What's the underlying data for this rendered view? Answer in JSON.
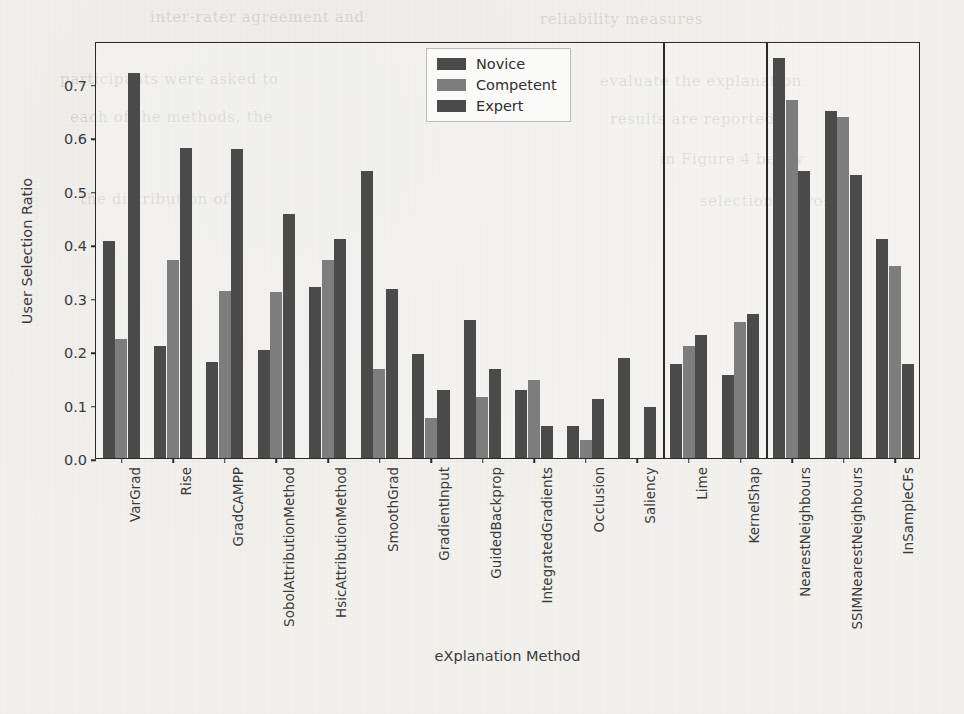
{
  "chart_data": {
    "type": "bar",
    "title": "",
    "xlabel": "eXplanation Method",
    "ylabel": "User Selection Ratio",
    "ylim": [
      0.0,
      0.78
    ],
    "ytick_labels": [
      "0.0",
      "0.1",
      "0.2",
      "0.3",
      "0.4",
      "0.5",
      "0.6",
      "0.7"
    ],
    "ytick_values": [
      0.0,
      0.1,
      0.2,
      0.3,
      0.4,
      0.5,
      0.6,
      0.7
    ],
    "grid": false,
    "legend_position": "upper center",
    "categories": [
      "VarGrad",
      "Rise",
      "GradCAMPP",
      "SobolAttributionMethod",
      "HsicAttributionMethod",
      "SmoothGrad",
      "GradientInput",
      "GuidedBackprop",
      "IntegratedGradients",
      "Occlusion",
      "Saliency",
      "Lime",
      "KernelShap",
      "NearestNeighbours",
      "SSIMNearestNeighbours",
      "InSampleCFs"
    ],
    "series": [
      {
        "name": "Novice",
        "color": "#4a4a4a",
        "values": [
          0.405,
          0.21,
          0.18,
          0.202,
          0.32,
          0.537,
          0.195,
          0.259,
          0.127,
          0.06,
          0.187,
          0.175,
          0.155,
          0.748,
          0.65,
          0.41
        ]
      },
      {
        "name": "Competent",
        "color": "#7d7d7d",
        "values": [
          0.222,
          0.37,
          0.312,
          0.31,
          0.37,
          0.167,
          0.075,
          0.115,
          0.145,
          0.033,
          0.0,
          0.21,
          0.255,
          0.67,
          0.637,
          0.36
        ]
      },
      {
        "name": "Expert",
        "color": "#4a4a4a",
        "values": [
          0.72,
          0.58,
          0.578,
          0.456,
          0.41,
          0.317,
          0.128,
          0.167,
          0.06,
          0.11,
          0.095,
          0.23,
          0.27,
          0.537,
          0.53,
          0.175
        ]
      }
    ],
    "group_separators_after": [
      10,
      12
    ]
  },
  "legend": {
    "entries": [
      {
        "label": "Novice"
      },
      {
        "label": "Competent"
      },
      {
        "label": "Expert"
      }
    ]
  },
  "axes": {
    "y_label": "User Selection Ratio",
    "x_label": "eXplanation Method"
  },
  "page_background_text": [
    {
      "text": "inter-rater agreement and",
      "x": 150,
      "y": 8
    },
    {
      "text": "reliability measures",
      "x": 540,
      "y": 10
    },
    {
      "text": "participants were asked to",
      "x": 60,
      "y": 70
    },
    {
      "text": "evaluate the explanation",
      "x": 600,
      "y": 72
    },
    {
      "text": "each of the methods, the",
      "x": 70,
      "y": 108
    },
    {
      "text": "results are reported",
      "x": 610,
      "y": 110
    },
    {
      "text": "in Figure 4 below",
      "x": 660,
      "y": 150
    },
    {
      "text": "the distribution of",
      "x": 80,
      "y": 190
    },
    {
      "text": "selections across",
      "x": 700,
      "y": 192
    }
  ]
}
